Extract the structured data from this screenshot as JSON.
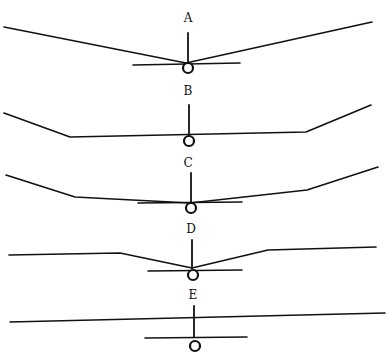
{
  "figure": {
    "title": "",
    "views": [
      {
        "label": "A",
        "description": "Straight dihedral wing mounted low",
        "label_pos": [
          188,
          22
        ],
        "wing_points": "4,27 186,63 372,22",
        "tail": [
          133,
          65,
          240,
          63
        ],
        "fin": [
          188,
          33,
          188,
          63
        ],
        "fuselage": [
          188,
          68,
          5
        ]
      },
      {
        "label": "B",
        "description": "Flat center section with dihedral tips",
        "label_pos": [
          188,
          95
        ],
        "wing_points": "4,113 70,137 306,132 371,105",
        "tail": null,
        "fin": [
          189,
          105,
          189,
          135
        ],
        "fuselage": [
          189,
          141,
          5
        ]
      },
      {
        "label": "C",
        "description": "Shallow dihedral center with steeper tips",
        "label_pos": [
          188,
          167
        ],
        "wing_points": "6,175 75,197 190,203 307,190 378,167",
        "tail": [
          138,
          203,
          242,
          202
        ],
        "fin": [
          191,
          173,
          191,
          203
        ],
        "fuselage": [
          191,
          208,
          5
        ]
      },
      {
        "label": "D",
        "description": "Dihedral center section with flat outer panels",
        "label_pos": [
          191,
          233
        ],
        "wing_points": "9,255 120,253 192,268 268,250 376,247",
        "tail": [
          148,
          271,
          242,
          270
        ],
        "fin": [
          192,
          240,
          192,
          268
        ],
        "fuselage": [
          193,
          275,
          5
        ]
      },
      {
        "label": "E",
        "description": "Flat high-mounted wing",
        "label_pos": [
          193,
          299
        ],
        "wing_points": "10,322 385,313",
        "tail": [
          145,
          338,
          247,
          337
        ],
        "fin": [
          194,
          306,
          194,
          337
        ],
        "fuselage": [
          195,
          346,
          5
        ]
      }
    ]
  }
}
